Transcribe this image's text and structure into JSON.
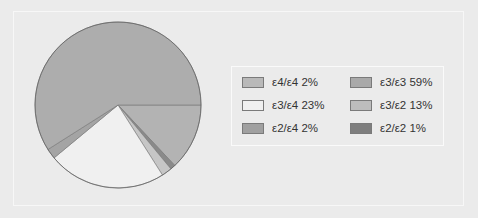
{
  "chart_data": {
    "type": "pie",
    "title": "",
    "slices": [
      {
        "label": "ε3/ε2",
        "value": 13,
        "color": "#b3b3b3"
      },
      {
        "label": "ε2/ε2",
        "value": 1,
        "color": "#8a8a8a"
      },
      {
        "label": "ε4/ε4",
        "value": 2,
        "color": "#c6c6c6"
      },
      {
        "label": "ε3/ε4",
        "value": 23,
        "color": "#f0f0f0"
      },
      {
        "label": "ε2/ε4",
        "value": 2,
        "color": "#a4a4a4"
      },
      {
        "label": "ε3/ε3",
        "value": 59,
        "color": "#adadad"
      }
    ],
    "legend_position": "right"
  },
  "legend": [
    {
      "label": "ε4/ε4 2%",
      "color": "#b9b9b9"
    },
    {
      "label": "ε3/ε3 59%",
      "color": "#a9a9a9"
    },
    {
      "label": "ε3/ε4 23%",
      "color": "#f0f0f0"
    },
    {
      "label": "ε3/ε2 13%",
      "color": "#bdbdbd"
    },
    {
      "label": "ε2/ε4 2%",
      "color": "#a0a0a0"
    },
    {
      "label": "ε2/ε2 1%",
      "color": "#7e7e7e"
    }
  ]
}
